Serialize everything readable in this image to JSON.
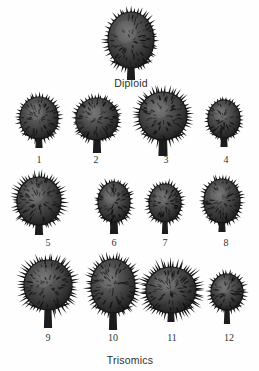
{
  "figure": {
    "background_color": "#fefefe",
    "ink_color": "#1d1d1d",
    "caption_color": "#333333",
    "top_group_label": "Diploid",
    "bottom_group_label": "Trisomics"
  },
  "specimens": [
    {
      "id": "diploid",
      "label": "Diploid",
      "row": 0,
      "cx": 131,
      "cy": 40,
      "pod_rx": 23,
      "pod_ry": 28,
      "stalk_w": 7,
      "stalk_h": 12,
      "spine_count": 46,
      "spine_len": 6,
      "shape": "tall-oval",
      "tone": "#3a3a3a"
    },
    {
      "id": "t1",
      "label": "1",
      "row": 1,
      "cx": 39,
      "cy": 118,
      "pod_rx": 19,
      "pod_ry": 21,
      "stalk_w": 6,
      "stalk_h": 9,
      "spine_count": 40,
      "spine_len": 5,
      "shape": "oval",
      "tone": "#333333"
    },
    {
      "id": "t2",
      "label": "2",
      "row": 1,
      "cx": 97,
      "cy": 119,
      "pod_rx": 21,
      "pod_ry": 21,
      "stalk_w": 7,
      "stalk_h": 13,
      "spine_count": 44,
      "spine_len": 5,
      "shape": "round",
      "tone": "#313131"
    },
    {
      "id": "t3",
      "label": "3",
      "row": 1,
      "cx": 163,
      "cy": 116,
      "pod_rx": 24,
      "pod_ry": 24,
      "stalk_w": 8,
      "stalk_h": 16,
      "spine_count": 50,
      "spine_len": 7,
      "shape": "broad-round",
      "tone": "#2e2e2e"
    },
    {
      "id": "t4",
      "label": "4",
      "row": 1,
      "cx": 224,
      "cy": 119,
      "pod_rx": 16,
      "pod_ry": 19,
      "stalk_w": 6,
      "stalk_h": 9,
      "spine_count": 34,
      "spine_len": 4,
      "shape": "small-oval",
      "tone": "#363636"
    },
    {
      "id": "t5",
      "label": "5",
      "row": 2,
      "cx": 39,
      "cy": 201,
      "pod_rx": 22,
      "pod_ry": 24,
      "stalk_w": 7,
      "stalk_h": 10,
      "spine_count": 50,
      "spine_len": 7,
      "shape": "bristly-oval",
      "tone": "#2f2f2f"
    },
    {
      "id": "t6",
      "label": "6",
      "row": 2,
      "cx": 114,
      "cy": 202,
      "pod_rx": 16,
      "pod_ry": 20,
      "stalk_w": 7,
      "stalk_h": 12,
      "spine_count": 36,
      "spine_len": 5,
      "shape": "oval",
      "tone": "#343434"
    },
    {
      "id": "t7",
      "label": "7",
      "row": 2,
      "cx": 165,
      "cy": 203,
      "pod_rx": 16,
      "pod_ry": 19,
      "stalk_w": 5,
      "stalk_h": 12,
      "spine_count": 36,
      "spine_len": 5,
      "shape": "oval",
      "tone": "#353535"
    },
    {
      "id": "t8",
      "label": "8",
      "row": 2,
      "cx": 222,
      "cy": 201,
      "pod_rx": 18,
      "pod_ry": 22,
      "stalk_w": 6,
      "stalk_h": 9,
      "spine_count": 40,
      "spine_len": 5,
      "shape": "tall-oval",
      "tone": "#323232"
    },
    {
      "id": "t9",
      "label": "9",
      "row": 3,
      "cx": 48,
      "cy": 285,
      "pod_rx": 24,
      "pod_ry": 25,
      "stalk_w": 7,
      "stalk_h": 18,
      "spine_count": 52,
      "spine_len": 8,
      "shape": "spiny-round",
      "tone": "#2c2c2c"
    },
    {
      "id": "t10",
      "label": "10",
      "row": 3,
      "cx": 113,
      "cy": 286,
      "pod_rx": 22,
      "pod_ry": 27,
      "stalk_w": 7,
      "stalk_h": 17,
      "spine_count": 50,
      "spine_len": 7,
      "shape": "tall-oval",
      "tone": "#2d2d2d"
    },
    {
      "id": "t11",
      "label": "11",
      "row": 3,
      "cx": 171,
      "cy": 290,
      "pod_rx": 25,
      "pod_ry": 23,
      "stalk_w": 6,
      "stalk_h": 9,
      "spine_count": 58,
      "spine_len": 9,
      "shape": "very-spiny-round",
      "tone": "#2b2b2b"
    },
    {
      "id": "t12",
      "label": "12",
      "row": 3,
      "cx": 227,
      "cy": 292,
      "pod_rx": 16,
      "pod_ry": 18,
      "stalk_w": 5,
      "stalk_h": 14,
      "spine_count": 34,
      "spine_len": 5,
      "shape": "small-oval",
      "tone": "#383838"
    }
  ],
  "captions": [
    {
      "id": "cap-diploid",
      "text": "Diploid",
      "x": 131,
      "y": 78,
      "kind": "group"
    },
    {
      "id": "cap-1",
      "text": "1",
      "x": 39,
      "y": 155,
      "kind": "number"
    },
    {
      "id": "cap-2",
      "text": "2",
      "x": 96,
      "y": 155,
      "kind": "number"
    },
    {
      "id": "cap-3",
      "text": "3",
      "x": 166,
      "y": 155,
      "kind": "number"
    },
    {
      "id": "cap-4",
      "text": "4",
      "x": 226,
      "y": 155,
      "kind": "number"
    },
    {
      "id": "cap-5",
      "text": "5",
      "x": 48,
      "y": 238,
      "kind": "number"
    },
    {
      "id": "cap-6",
      "text": "6",
      "x": 114,
      "y": 238,
      "kind": "number"
    },
    {
      "id": "cap-7",
      "text": "7",
      "x": 165,
      "y": 238,
      "kind": "number"
    },
    {
      "id": "cap-8",
      "text": "8",
      "x": 226,
      "y": 238,
      "kind": "number"
    },
    {
      "id": "cap-9",
      "text": "9",
      "x": 48,
      "y": 333,
      "kind": "number"
    },
    {
      "id": "cap-10",
      "text": "10",
      "x": 113,
      "y": 333,
      "kind": "number"
    },
    {
      "id": "cap-11",
      "text": "11",
      "x": 172,
      "y": 333,
      "kind": "number"
    },
    {
      "id": "cap-12",
      "text": "12",
      "x": 229,
      "y": 333,
      "kind": "number"
    },
    {
      "id": "cap-trisomics",
      "text": "Trisomics",
      "x": 130,
      "y": 355,
      "kind": "group"
    }
  ]
}
